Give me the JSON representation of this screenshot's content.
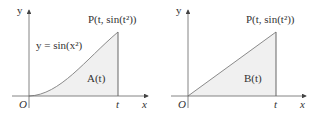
{
  "figures": [
    {
      "id": "left",
      "curve_label": "y = sin(x²)",
      "point_label": "P(t, sin(t²))",
      "area_label": "A(t)",
      "origin_label": "O",
      "x_axis_label": "x",
      "y_axis_label": "y",
      "t_label": "t"
    },
    {
      "id": "right",
      "point_label": "P(t, sin(t²))",
      "area_label": "B(t)",
      "origin_label": "O",
      "x_axis_label": "x",
      "y_axis_label": "y",
      "t_label": "t"
    }
  ],
  "colors": {
    "axis": "#555555",
    "curve": "#8a8a8a",
    "fill": "#f2f2f2"
  }
}
